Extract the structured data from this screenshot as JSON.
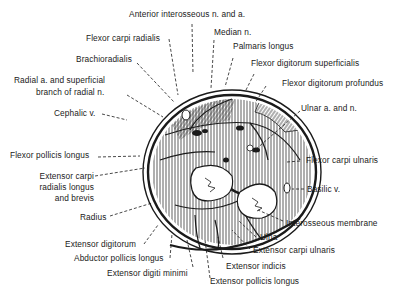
{
  "diagram": {
    "type": "anatomical cross-section",
    "colors": {
      "ink": "#1a1a1a",
      "background": "#ffffff"
    },
    "labels": {
      "anterior_interosseous": "Anterior interosseous n. and a.",
      "median_n": "Median n.",
      "flexor_carpi_radialis": "Flexor carpi radialis",
      "palmaris_longus": "Palmaris longus",
      "brachioradialis": "Brachioradialis",
      "flexor_digitorum_superficialis": "Flexor digitorum superficialis",
      "radial_a_1": "Radial a. and superficial",
      "radial_a_2": "branch of radial n.",
      "flexor_digitorum_profundus": "Flexor digitorum profundus",
      "cephalic_v": "Cephalic v.",
      "ulnar_a_n": "Ulnar a. and n.",
      "flexor_pollicis_longus": "Flexor pollicis longus",
      "flexor_carpi_ulnaris": "Flexor carpi ulnaris",
      "ecrl_1": "Extensor carpi",
      "ecrl_2": "radialis longus",
      "ecrl_3": "and brevis",
      "basilic_v": "Basilic v.",
      "radius": "Radius",
      "interosseous_membrane": "Interosseous membrane",
      "ulna": "Ulna",
      "extensor_digitorum": "Extensor digitorum",
      "extensor_carpi_ulnaris": "Extensor carpi ulnaris",
      "abductor_pollicis_longus": "Abductor pollicis longus",
      "extensor_indicis": "Extensor indicis",
      "extensor_digiti_minimi": "Extensor digiti minimi",
      "extensor_pollicis_longus": "Extensor pollicis longus"
    }
  }
}
